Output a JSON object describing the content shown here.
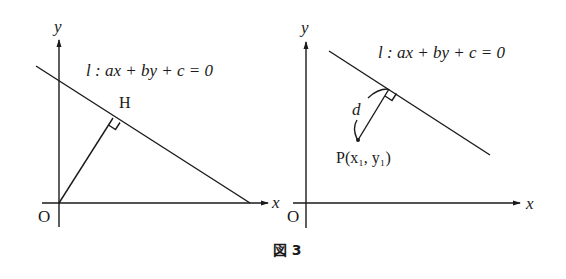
{
  "figure": {
    "caption": "図 3",
    "colors": {
      "ink": "#1a1a1a",
      "background": "#ffffff"
    },
    "left_panel": {
      "axis_x_label": "x",
      "axis_y_label": "y",
      "origin_label": "O",
      "line_equation": "l : ax + by + c = 0",
      "foot_label": "H",
      "elements": [
        "x-axis",
        "y-axis",
        "line l",
        "segment OH perpendicular to l",
        "right-angle marker at H"
      ]
    },
    "right_panel": {
      "axis_x_label": "x",
      "axis_y_label": "y",
      "origin_label": "O",
      "line_equation": "l : ax + by + c = 0",
      "distance_label": "d",
      "point_label": "P(x₁, y₁)",
      "elements": [
        "x-axis",
        "y-axis",
        "line l",
        "perpendicular from P to l",
        "right-angle marker",
        "curved distance brace d"
      ]
    }
  }
}
